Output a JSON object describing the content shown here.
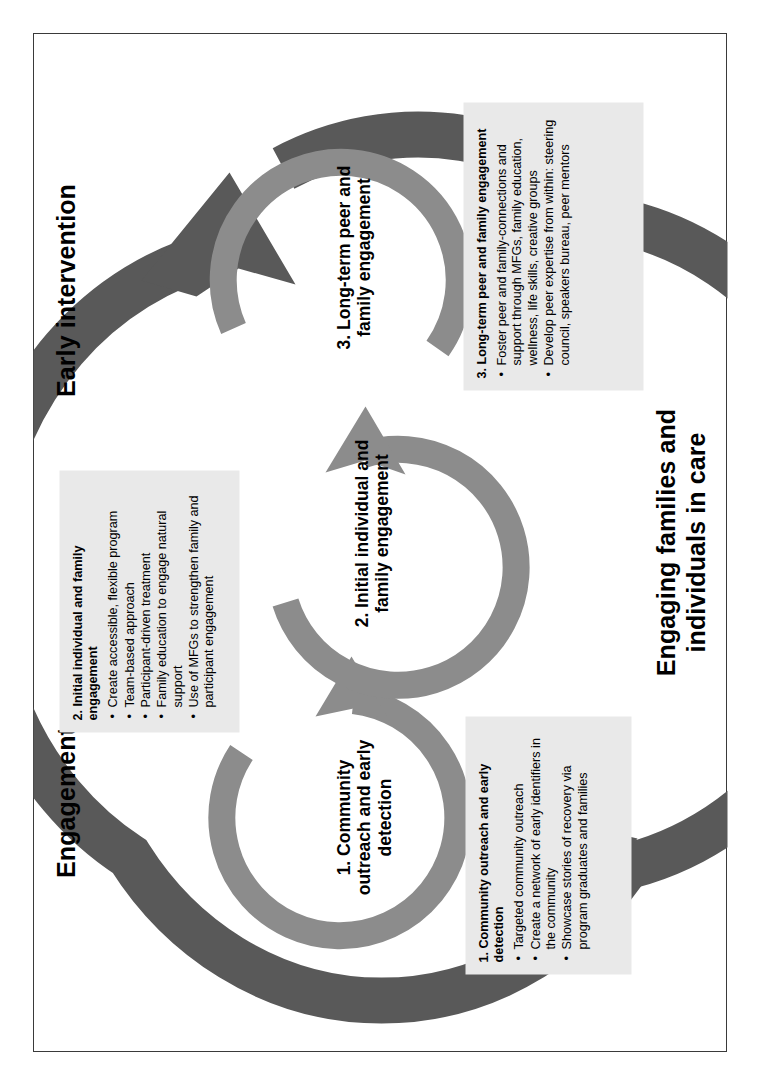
{
  "diagram": {
    "title_engagement": "Engagement",
    "title_early_intervention": "Early intervention",
    "title_engaging_in_care": "Engaging families and individuals in care",
    "rings": [
      {
        "label": "1. Community outreach and early detection"
      },
      {
        "label": "2. Initial individual and family engagement"
      },
      {
        "label": "3. Long-term peer and family engagement"
      }
    ],
    "boxes": [
      {
        "title": "1. Community outreach and early detection",
        "bullets": [
          "Targeted community outreach",
          "Create a network of early identifiers in the community",
          "Showcase stories of recovery via program graduates and families"
        ]
      },
      {
        "title": "2. Initial individual and family engagement",
        "bullets": [
          "Create accessible, flexible program",
          "Team-based approach",
          "Participant-driven treatment",
          "Family education to engage natural support",
          "Use of MFGs to strengthen family and participant engagement"
        ]
      },
      {
        "title": "3. Long-term peer and family engagement",
        "bullets": [
          "Foster peer and family-connections and support through MFGs, family education, wellness, life skills, creative groups",
          "Develop peer expertise from within: steering council, speakers bureau, peer mentors"
        ]
      }
    ],
    "colors": {
      "outer_arc": "#595959",
      "inner_ring": "#8c8c8c",
      "box_background": "#e9e9e9",
      "frame_border": "#3a3a3a",
      "text": "#000000",
      "page_background": "#ffffff"
    }
  }
}
